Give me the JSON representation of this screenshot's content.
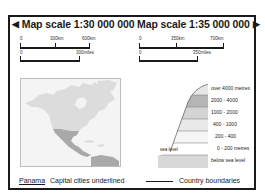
{
  "title": {
    "left": {
      "arrow": "◀",
      "label": "Map scale 1:30 000 000"
    },
    "right": {
      "label": "Map scale 1:35 000 000",
      "arrow": "▶"
    }
  },
  "scales": {
    "left": {
      "km": {
        "ticks": [
          "0",
          "300km",
          "600km"
        ]
      },
      "miles": {
        "ticks": [
          "0",
          "300miles"
        ]
      }
    },
    "right": {
      "km": {
        "ticks": [
          "0",
          "350km",
          "700km"
        ]
      },
      "miles": {
        "ticks": [
          "0",
          "350miles"
        ]
      }
    }
  },
  "inset_map": {
    "region": "North America",
    "colors": {
      "background": "#f4f4f4",
      "land": "#dcdcdc",
      "highlight": "#a9a9a9",
      "border": "#bdbdbd"
    }
  },
  "elevation_key": {
    "bands": [
      {
        "label": "over 4000 metres",
        "color": "#e6e6e6"
      },
      {
        "label": "2000 - 4000",
        "color": "#b5b5b5"
      },
      {
        "label": "1000 - 2000",
        "color": "#d3d3d3"
      },
      {
        "label": "400 - 1000",
        "color": "#e9e9e9"
      },
      {
        "label": "200 - 400",
        "color": "#f5f5f5"
      },
      {
        "label": "0 - 200 metres",
        "color": "#ffffff"
      },
      {
        "label": "below sea level",
        "color": "#d8d8d8"
      }
    ],
    "sea_level_label": "sea level"
  },
  "footer": {
    "capital_example": "Panama",
    "capital_text": "Capital cities underlined",
    "boundary_text": "Country boundaries"
  }
}
